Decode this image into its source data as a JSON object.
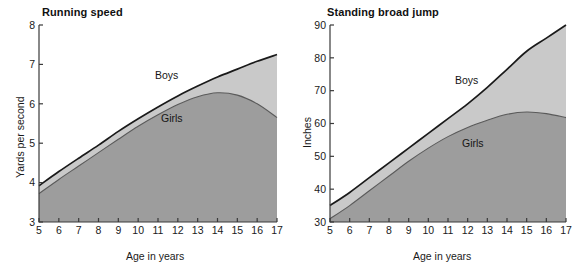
{
  "figure": {
    "panels": [
      {
        "id": "running-speed",
        "title": "Running speed",
        "xlabel": "Age in years",
        "ylabel": "Yards per second"
      },
      {
        "id": "standing-broad-jump",
        "title": "Standing broad jump",
        "xlabel": "Age in years",
        "ylabel": "Inches"
      }
    ],
    "colors": {
      "boys_fill": "#c9c9c9",
      "girls_fill": "#9d9d9d",
      "line": "#1a1a1a",
      "girls_line": "#5a5a5a",
      "axis": "#3a3a3a",
      "background": "#ffffff"
    },
    "series_labels": {
      "boys": "Boys",
      "girls": "Girls"
    }
  },
  "chart_data": [
    {
      "type": "area",
      "title": "Running speed",
      "xlabel": "Age in years",
      "ylabel": "Yards per second",
      "xlim": [
        5,
        17
      ],
      "ylim": [
        3,
        8
      ],
      "xticks": [
        5,
        6,
        7,
        8,
        9,
        10,
        11,
        12,
        13,
        14,
        15,
        16,
        17
      ],
      "yticks": [
        3,
        4,
        5,
        6,
        7,
        8
      ],
      "xticklabels": [
        "5",
        "6",
        "7",
        "8",
        "9",
        "10",
        "11",
        "12",
        "13",
        "14",
        "15",
        "16",
        "17"
      ],
      "yticklabels": [
        "3",
        "4",
        "5",
        "6",
        "7",
        "8"
      ],
      "grid": false,
      "legend": "inline-annotation",
      "x": [
        5,
        6,
        7,
        8,
        9,
        10,
        11,
        12,
        13,
        14,
        15,
        16,
        17
      ],
      "series": [
        {
          "name": "Boys",
          "values": [
            3.92,
            4.28,
            4.62,
            4.95,
            5.3,
            5.62,
            5.92,
            6.2,
            6.45,
            6.68,
            6.88,
            7.08,
            7.25
          ]
        },
        {
          "name": "Girls",
          "values": [
            3.72,
            4.08,
            4.42,
            4.76,
            5.1,
            5.43,
            5.72,
            5.98,
            6.18,
            6.28,
            6.22,
            6.0,
            5.65
          ]
        }
      ]
    },
    {
      "type": "area",
      "title": "Standing broad jump",
      "xlabel": "Age in years",
      "ylabel": "Inches",
      "xlim": [
        5,
        17
      ],
      "ylim": [
        30,
        90
      ],
      "xticks": [
        5,
        6,
        7,
        8,
        9,
        10,
        11,
        12,
        13,
        14,
        15,
        16,
        17
      ],
      "yticks": [
        30,
        40,
        50,
        60,
        70,
        80,
        90
      ],
      "xticklabels": [
        "5",
        "6",
        "7",
        "8",
        "9",
        "10",
        "11",
        "12",
        "13",
        "14",
        "15",
        "16",
        "17"
      ],
      "yticklabels": [
        "30",
        "40",
        "50",
        "60",
        "70",
        "80",
        "90"
      ],
      "grid": false,
      "legend": "inline-annotation",
      "x": [
        5,
        6,
        7,
        8,
        9,
        10,
        11,
        12,
        13,
        14,
        15,
        16,
        17
      ],
      "series": [
        {
          "name": "Boys",
          "values": [
            35,
            39,
            43.5,
            48,
            52.5,
            57,
            61.5,
            66,
            71,
            76.5,
            82,
            86,
            90
          ]
        },
        {
          "name": "Girls",
          "values": [
            31,
            35,
            39.5,
            44,
            48.5,
            52.5,
            56,
            58.8,
            61,
            62.8,
            63.5,
            63,
            61.8
          ]
        }
      ]
    }
  ]
}
